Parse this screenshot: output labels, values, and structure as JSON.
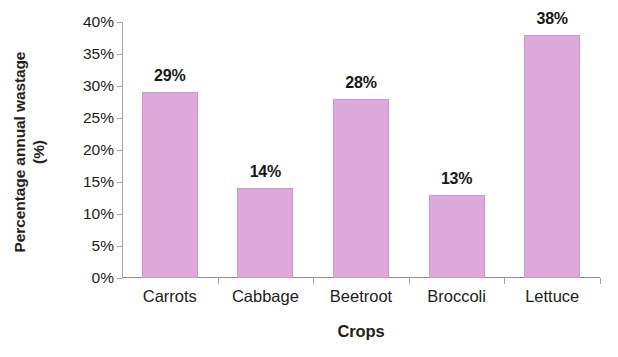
{
  "chart_data": {
    "type": "bar",
    "title": "",
    "categories": [
      "Carrots",
      "Cabbage",
      "Beetroot",
      "Broccoli",
      "Lettuce"
    ],
    "values": [
      29,
      14,
      28,
      13,
      38
    ],
    "value_labels": [
      "29%",
      "14%",
      "28%",
      "13%",
      "38%"
    ],
    "xlabel": "Crops",
    "ylabel_line1": "Percentage annual wastage",
    "ylabel_line2": "(%)",
    "ylabel": "Percentage annual wastage (%)",
    "ylim": [
      0,
      40
    ],
    "ytick_values": [
      0,
      5,
      10,
      15,
      20,
      25,
      30,
      35,
      40
    ],
    "ytick_labels": [
      "0%",
      "5%",
      "10%",
      "15%",
      "20%",
      "25%",
      "30%",
      "35%",
      "40%"
    ],
    "grid": false,
    "legend": false,
    "legend_position": "none",
    "bar_color": "#dda9dc",
    "bar_edge_color": "#cf96cd",
    "axis_color": "#a6a6a6",
    "text_color": "#231f20",
    "background_color": "#ffffff"
  }
}
